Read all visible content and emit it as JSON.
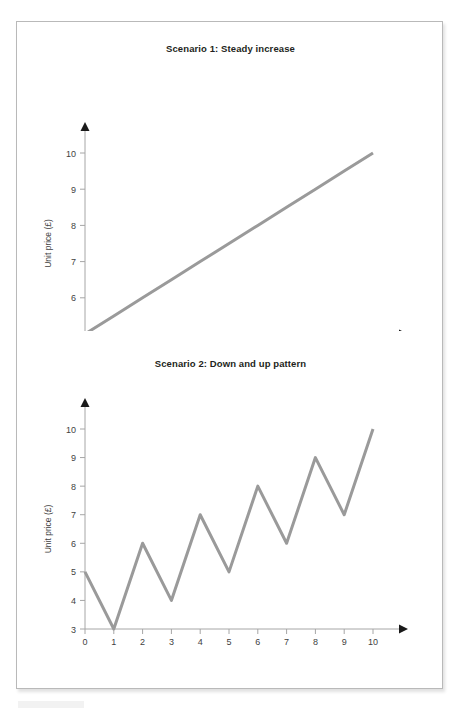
{
  "document": {
    "page_background": "#ffffff",
    "frame_border_color": "#b9b9b9",
    "line_color": "#9a9a9a",
    "axis_color": "#a6a6a6",
    "arrow_color": "#1a1a1a",
    "title_color": "#231f20"
  },
  "figures": [
    {
      "title": "Scenario 1: Steady increase",
      "xlabel": "Year",
      "ylabel": "Unit price (£)"
    },
    {
      "title": "Scenario 2: Down and up pattern",
      "xlabel": "Year",
      "ylabel": "Unit price (£)"
    }
  ],
  "chart_data": [
    {
      "type": "line",
      "title": "Scenario 1: Steady increase",
      "xlabel": "Year",
      "ylabel": "Unit price (£)",
      "x": [
        0,
        1,
        2,
        3,
        4,
        5,
        6,
        7,
        8,
        9,
        10
      ],
      "values": [
        5,
        5.5,
        6,
        6.5,
        7,
        7.5,
        8,
        8.5,
        9,
        9.5,
        10
      ],
      "xlim": [
        0,
        10
      ],
      "ylim": [
        5,
        10
      ],
      "xticks": [
        0,
        1,
        2,
        3,
        4,
        5,
        6,
        7,
        8,
        9,
        10
      ],
      "yticks": [
        5,
        6,
        7,
        8,
        9,
        10
      ],
      "xtick_labels": [
        "0",
        "1",
        "2",
        "3",
        "4",
        "5",
        "6",
        "7",
        "8",
        "9",
        "10"
      ],
      "ytick_labels": [
        "5",
        "6",
        "7",
        "8",
        "9",
        "10"
      ],
      "grid": false,
      "legend": false,
      "series_color": "#9a9a9a"
    },
    {
      "type": "line",
      "title": "Scenario 2: Down and up pattern",
      "xlabel": "Year",
      "ylabel": "Unit price (£)",
      "x": [
        0,
        1,
        2,
        3,
        4,
        5,
        6,
        7,
        8,
        9,
        10
      ],
      "values": [
        5,
        3,
        6,
        4,
        7,
        5,
        8,
        6,
        9,
        7,
        10
      ],
      "xlim": [
        0,
        10
      ],
      "ylim": [
        3,
        10
      ],
      "xticks": [
        0,
        1,
        2,
        3,
        4,
        5,
        6,
        7,
        8,
        9,
        10
      ],
      "yticks": [
        3,
        4,
        5,
        6,
        7,
        8,
        9,
        10
      ],
      "xtick_labels": [
        "0",
        "1",
        "2",
        "3",
        "4",
        "5",
        "6",
        "7",
        "8",
        "9",
        "10"
      ],
      "ytick_labels": [
        "3",
        "4",
        "5",
        "6",
        "7",
        "8",
        "9",
        "10"
      ],
      "grid": false,
      "legend": false,
      "series_color": "#9a9a9a"
    }
  ]
}
